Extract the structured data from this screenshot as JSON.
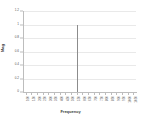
{
  "chart_data": {
    "type": "line",
    "title": "",
    "subtitle": "",
    "xlabel": "Frequency",
    "ylabel": "Mag",
    "grid": true,
    "legend": false,
    "legend_position": "none",
    "series_color": "#8c8c8c",
    "grid_color": "#e9e9e9",
    "axis_color": "#bdbdbd",
    "background": "#ffffff",
    "ylim": [
      0,
      1.2
    ],
    "yticks": [
      0,
      0.2,
      0.4,
      0.6,
      0.8,
      1,
      1.2
    ],
    "ytick_labels": [
      "0",
      "0.2",
      "0.4",
      "0.6",
      "0.8",
      "1",
      "1.2"
    ],
    "x_categories": [
      "100",
      "150",
      "200",
      "250",
      "300",
      "350",
      "400",
      "450",
      "500",
      "550",
      "600",
      "650",
      "700",
      "750",
      "800",
      "850",
      "900",
      "950",
      "1000",
      "1050"
    ],
    "values": [
      0,
      0,
      0,
      0,
      0,
      0,
      0,
      0,
      0,
      1.0,
      0,
      0,
      0,
      0,
      0,
      0,
      0,
      0,
      0,
      0
    ],
    "peak": {
      "category": "550",
      "value": 1.0
    },
    "annotations": []
  }
}
